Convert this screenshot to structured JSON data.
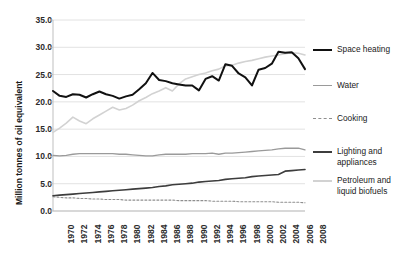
{
  "chart_data": {
    "type": "line",
    "title": "",
    "subtitle": "",
    "xlabel": "",
    "ylabel": "Million tonnes of oil equivalent",
    "xlim": [
      1970,
      2008
    ],
    "ylim": [
      0.0,
      35.0
    ],
    "ytick_step": 5.0,
    "yticks": [
      "35.0",
      "30.0",
      "25.0",
      "20.0",
      "15.0",
      "10.0",
      "5.0",
      "0.0"
    ],
    "ytick_values": [
      35.0,
      30.0,
      25.0,
      20.0,
      15.0,
      10.0,
      5.0,
      0.0
    ],
    "xticks": [
      "1970",
      "1972",
      "1974",
      "1976",
      "1978",
      "1980",
      "1982",
      "1984",
      "1986",
      "1988",
      "1990",
      "1992",
      "1994",
      "1996",
      "1998",
      "2000",
      "2002",
      "2004",
      "2006",
      "2008"
    ],
    "x": [
      1970,
      1971,
      1972,
      1973,
      1974,
      1975,
      1976,
      1977,
      1978,
      1979,
      1980,
      1981,
      1982,
      1983,
      1984,
      1985,
      1986,
      1987,
      1988,
      1989,
      1990,
      1991,
      1992,
      1993,
      1994,
      1995,
      1996,
      1997,
      1998,
      1999,
      2000,
      2001,
      2002,
      2003,
      2004,
      2005,
      2006,
      2007,
      2008
    ],
    "grid": true,
    "grid_axis": "y",
    "legend_position": "right",
    "series": [
      {
        "name": "Space heating",
        "color": "#111111",
        "width": 2.0,
        "dash": "solid",
        "values": [
          22.0,
          21.1,
          20.9,
          21.4,
          21.3,
          20.8,
          21.4,
          21.9,
          21.4,
          21.1,
          20.6,
          21.0,
          21.3,
          22.3,
          23.4,
          25.3,
          24.0,
          23.8,
          23.4,
          23.2,
          23.0,
          23.0,
          22.1,
          24.2,
          24.7,
          23.9,
          26.9,
          26.6,
          25.2,
          24.5,
          23.0,
          25.9,
          26.2,
          27.0,
          29.2,
          29.0,
          29.1,
          28.0,
          26.0
        ]
      },
      {
        "name": "Water",
        "color": "#9a9a9a",
        "width": 1.3,
        "dash": "solid",
        "values": [
          10.2,
          10.1,
          10.2,
          10.4,
          10.5,
          10.5,
          10.5,
          10.5,
          10.5,
          10.5,
          10.4,
          10.4,
          10.3,
          10.2,
          10.1,
          10.1,
          10.3,
          10.4,
          10.4,
          10.4,
          10.4,
          10.5,
          10.5,
          10.5,
          10.6,
          10.4,
          10.6,
          10.6,
          10.7,
          10.8,
          10.9,
          11.0,
          11.1,
          11.2,
          11.4,
          11.5,
          11.5,
          11.5,
          11.2
        ]
      },
      {
        "name": "Cooking",
        "color": "#8f8f8f",
        "width": 1.1,
        "dash": "dashed",
        "values": [
          2.6,
          2.5,
          2.4,
          2.4,
          2.3,
          2.3,
          2.2,
          2.2,
          2.1,
          2.1,
          2.1,
          2.0,
          2.0,
          2.0,
          2.0,
          2.0,
          2.0,
          2.0,
          2.0,
          1.9,
          1.9,
          1.9,
          1.9,
          1.9,
          1.8,
          1.8,
          1.8,
          1.8,
          1.7,
          1.7,
          1.7,
          1.7,
          1.7,
          1.7,
          1.6,
          1.6,
          1.6,
          1.6,
          1.5
        ]
      },
      {
        "name": "Lighting and appliances",
        "color": "#3d3d3d",
        "width": 1.6,
        "dash": "solid",
        "values": [
          2.8,
          2.9,
          3.0,
          3.1,
          3.2,
          3.3,
          3.4,
          3.5,
          3.6,
          3.7,
          3.8,
          3.9,
          4.0,
          4.1,
          4.2,
          4.3,
          4.5,
          4.6,
          4.8,
          4.9,
          5.0,
          5.1,
          5.3,
          5.4,
          5.5,
          5.6,
          5.8,
          5.9,
          6.0,
          6.1,
          6.3,
          6.4,
          6.5,
          6.6,
          6.7,
          7.3,
          7.4,
          7.5,
          7.6
        ]
      },
      {
        "name": "Petroleum and liquid biofuels",
        "color": "#d2d2d2",
        "width": 1.6,
        "dash": "solid",
        "values": [
          14.4,
          15.2,
          16.1,
          17.2,
          16.5,
          16.0,
          16.9,
          17.6,
          18.3,
          19.0,
          18.5,
          18.8,
          19.4,
          20.2,
          20.8,
          21.5,
          22.0,
          22.6,
          22.0,
          23.3,
          24.2,
          24.6,
          25.0,
          25.3,
          25.7,
          26.0,
          26.6,
          26.7,
          27.1,
          27.4,
          27.6,
          27.9,
          28.2,
          28.4,
          28.6,
          28.8,
          29.0,
          28.9,
          28.6
        ]
      }
    ]
  },
  "legend": {
    "entries": [
      {
        "label": "Space heating"
      },
      {
        "label": "Water"
      },
      {
        "label": "Cooking"
      },
      {
        "label": "Lighting and\nappliances"
      },
      {
        "label": "Petroleum and\nliquid biofuels"
      }
    ]
  },
  "colors": {
    "space_heating": "#111111",
    "water": "#9a9a9a",
    "cooking": "#8f8f8f",
    "lighting": "#3d3d3d",
    "petroleum": "#d2d2d2",
    "gridline": "#e2e2e2",
    "axis": "#bfbfbf",
    "text": "#1a1a1a",
    "background": "#ffffff"
  }
}
